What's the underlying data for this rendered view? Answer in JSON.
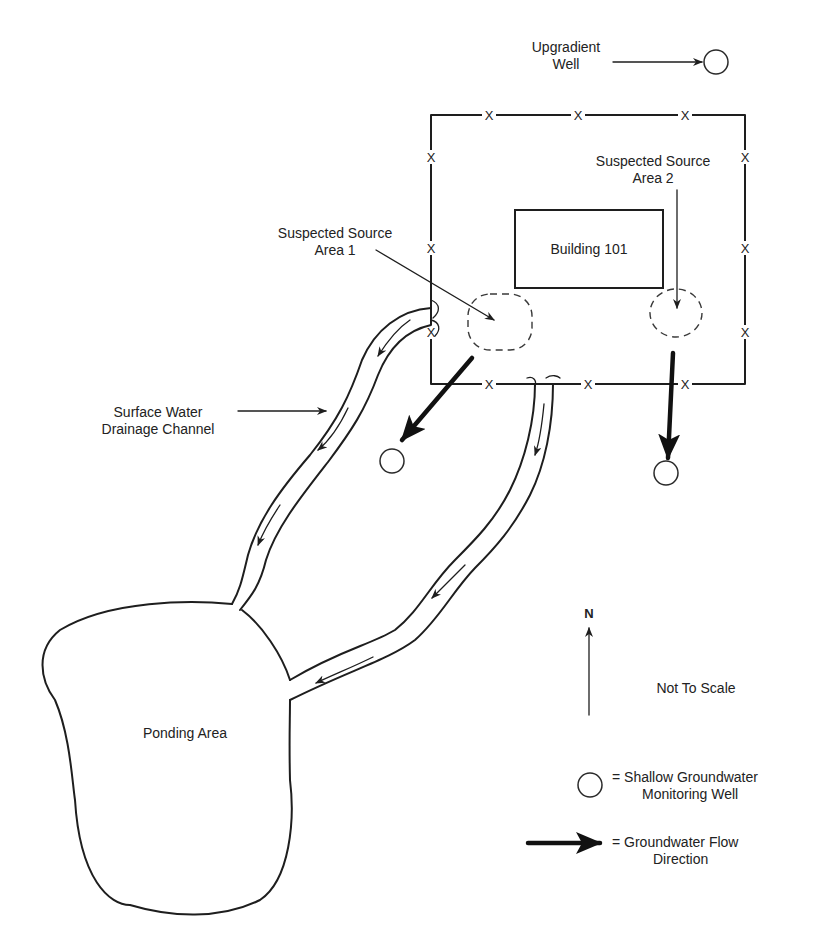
{
  "labels": {
    "upgradient_well": [
      "Upgradient",
      "Well"
    ],
    "source_area_1": [
      "Suspected Source",
      "Area 1"
    ],
    "source_area_2": [
      "Suspected Source",
      "Area 2"
    ],
    "building": "Building 101",
    "drainage_channel": [
      "Surface Water",
      "Drainage Channel"
    ],
    "ponding_area": "Ponding Area",
    "north": "N",
    "scale_note": "Not To Scale",
    "fence_marker": "X"
  },
  "legend": {
    "well": [
      "= Shallow Groundwater",
      "Monitoring Well"
    ],
    "flow": [
      "= Groundwater Flow",
      "Direction"
    ]
  },
  "icons": {
    "well": "circle-outline",
    "flow": "thick-arrow-right",
    "north": "arrow-up",
    "fence": "x-marker"
  },
  "colors": {
    "line": "#1e1e1e",
    "background": "#ffffff"
  }
}
